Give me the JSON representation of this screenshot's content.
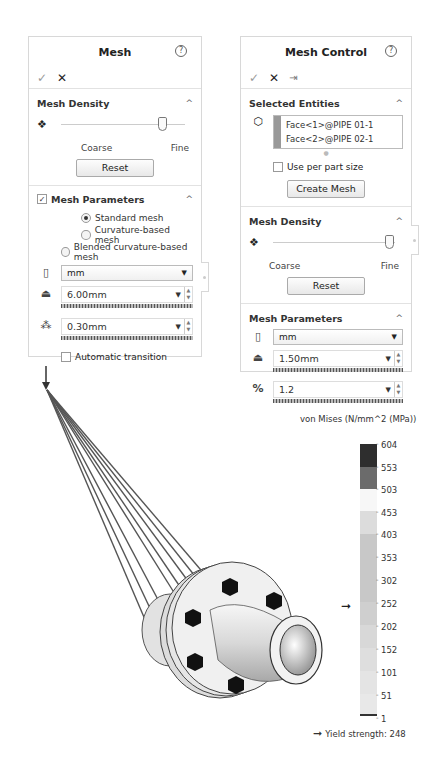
{
  "mesh_panel": {
    "title": "Mesh",
    "help_icon": "?",
    "ok_icon": "✓",
    "cancel_icon": "✕",
    "density": {
      "title": "Mesh Density",
      "coarse_label": "Coarse",
      "fine_label": "Fine",
      "slider_position_pct": 78,
      "reset_label": "Reset"
    },
    "parameters": {
      "title": "Mesh Parameters",
      "checked": true,
      "options": [
        {
          "label": "Standard mesh",
          "selected": true
        },
        {
          "label": "Curvature-based mesh",
          "selected": false
        },
        {
          "label": "Blended curvature-based mesh",
          "selected": false
        }
      ],
      "unit": "mm",
      "global_size": "6.00mm",
      "tolerance": "0.30mm",
      "auto_transition_label": "Automatic transition",
      "auto_transition_checked": false
    }
  },
  "mesh_control_panel": {
    "title": "Mesh Control",
    "help_icon": "?",
    "ok_icon": "✓",
    "cancel_icon": "✕",
    "pin_icon": "⇥",
    "selected_entities": {
      "title": "Selected Entities",
      "items": [
        "Face<1>@PIPE 01-1",
        "Face<2>@PIPE 02-1"
      ],
      "per_part_label": "Use per part size",
      "per_part_checked": false,
      "create_mesh_label": "Create Mesh"
    },
    "density": {
      "title": "Mesh Density",
      "coarse_label": "Coarse",
      "fine_label": "Fine",
      "slider_position_pct": 92,
      "reset_label": "Reset"
    },
    "parameters": {
      "title": "Mesh Parameters",
      "unit": "mm",
      "element_size": "1.50mm",
      "ratio": "1.2"
    }
  },
  "legend": {
    "title": "von Mises (N/mm^2 (MPa))",
    "ticks": [
      "604",
      "553",
      "503",
      "453",
      "403",
      "353",
      "302",
      "252",
      "202",
      "152",
      "101",
      "51",
      "1"
    ],
    "segment_colors": [
      "#2e2e2e",
      "#6b6b6b",
      "#f7f7f7",
      "#dcdcdc",
      "#c8c8c8",
      "#c8c8c8",
      "#c8c8c8",
      "#cfcfcf",
      "#d8d8d8",
      "#dedede",
      "#e4e4e4",
      "#e8e8e8"
    ],
    "yield_label": "Yield strength: 248",
    "yield_value": 248
  }
}
